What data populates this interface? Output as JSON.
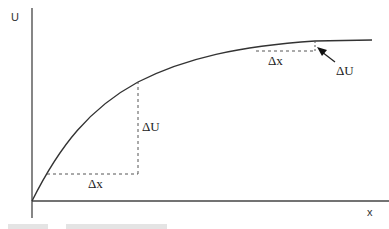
{
  "diagram": {
    "title": "",
    "axes": {
      "y_label": "U",
      "x_label": "x"
    },
    "curve": {
      "description": "concave increasing curve (diminishing returns), rising from origin and flattening toward an asymptote",
      "points": [
        [
          32,
          201
        ],
        [
          50,
          165
        ],
        [
          75,
          128
        ],
        [
          100,
          104
        ],
        [
          138,
          82
        ],
        [
          180,
          64
        ],
        [
          225,
          52
        ],
        [
          270,
          45
        ],
        [
          315,
          41
        ],
        [
          372,
          40
        ]
      ]
    },
    "annotations": [
      {
        "id": "lower-dx",
        "label": "Δx",
        "position": "below horizontal dashed segment near origin"
      },
      {
        "id": "lower-du",
        "label": "ΔU",
        "position": "right of vertical dashed segment (large rise)"
      },
      {
        "id": "upper-dx",
        "label": "Δx",
        "position": "below horizontal dashed segment near plateau"
      },
      {
        "id": "upper-du",
        "label": "ΔU",
        "position": "arrow pointing to small rise near plateau"
      }
    ],
    "colors": {
      "line": "#333333",
      "dash": "#555555",
      "background": "#ffffff"
    }
  }
}
